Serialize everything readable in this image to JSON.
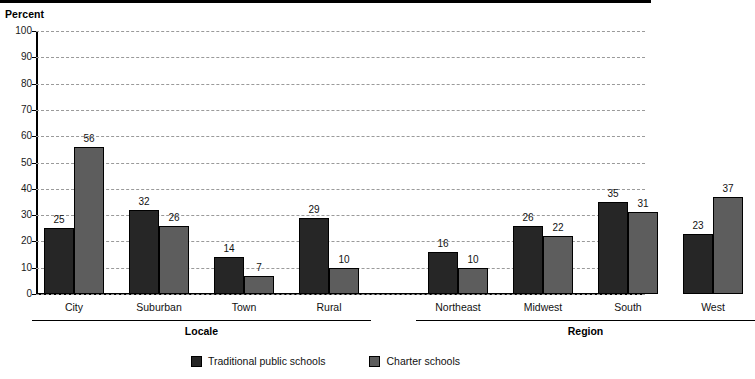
{
  "chart_data": {
    "type": "bar",
    "title": "",
    "ylabel": "Percent",
    "xlabel": "",
    "ylim": [
      0,
      100
    ],
    "ytick_step": 10,
    "yticks": [
      100,
      90,
      80,
      70,
      60,
      50,
      40,
      30,
      20,
      10,
      0
    ],
    "grid": true,
    "legend_position": "bottom-center",
    "categories": [
      "City",
      "Suburban",
      "Town",
      "Rural",
      "Northeast",
      "Midwest",
      "South",
      "West"
    ],
    "series": [
      {
        "name": "Traditional public schools",
        "color": "#262626",
        "values": [
          25,
          32,
          14,
          29,
          16,
          26,
          35,
          23
        ]
      },
      {
        "name": "Charter schools",
        "color": "#5d5d5d",
        "values": [
          56,
          26,
          7,
          10,
          10,
          22,
          31,
          37
        ]
      }
    ],
    "groups": [
      {
        "label": "Locale",
        "categories": [
          "City",
          "Suburban",
          "Town",
          "Rural"
        ]
      },
      {
        "label": "Region",
        "categories": [
          "Northeast",
          "Midwest",
          "South",
          "West"
        ]
      }
    ]
  },
  "axis": {
    "y_title": "Percent"
  },
  "legend": {
    "items": [
      {
        "label": "Traditional public schools",
        "color": "#262626"
      },
      {
        "label": "Charter schools",
        "color": "#5d5d5d"
      }
    ]
  }
}
